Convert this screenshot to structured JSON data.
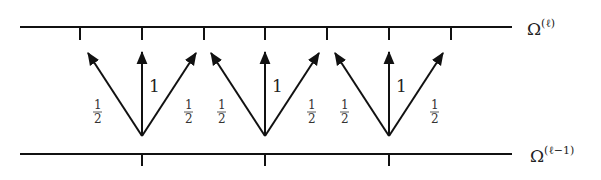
{
  "diagram": {
    "type": "prolongation-stencil",
    "levels": {
      "fine": {
        "label_base": "Ω",
        "label_sup": "(ℓ)"
      },
      "coarse": {
        "label_base": "Ω",
        "label_sup": "(ℓ−1)"
      }
    },
    "fine_ticks": [
      80,
      142,
      204,
      265,
      327,
      389,
      451
    ],
    "coarse_ticks": [
      142,
      265,
      389
    ],
    "stencils": [
      {
        "center_x": 142,
        "weights": {
          "left": "1/2",
          "center": "1",
          "right": "1/2"
        }
      },
      {
        "center_x": 265,
        "weights": {
          "left": "1/2",
          "center": "1",
          "right": "1/2"
        }
      },
      {
        "center_x": 389,
        "weights": {
          "left": "1/2",
          "center": "1",
          "right": "1/2"
        }
      }
    ],
    "weight_center": "1",
    "weight_side_num": "1",
    "weight_side_den": "2",
    "colors": {
      "stroke": "#111111",
      "background": "#ffffff"
    }
  }
}
